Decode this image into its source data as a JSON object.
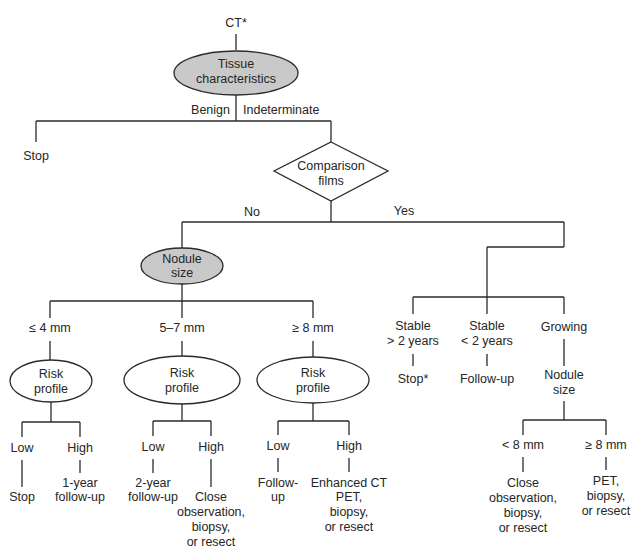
{
  "root": {
    "label": "CT*"
  },
  "tissue": {
    "line1": "Tissue",
    "line2": "characteristics",
    "fill": "#c9c9c9"
  },
  "branches_tissue": {
    "benign": "Benign",
    "indeterminate": "Indeterminate"
  },
  "benign_outcome": "Stop",
  "comparison": {
    "line1": "Comparison",
    "line2": "films"
  },
  "branches_comparison": {
    "no": "No",
    "yes": "Yes"
  },
  "nodule": {
    "line1": "Nodule",
    "line2": "size",
    "fill": "#c9c9c9"
  },
  "size_branches": [
    "≤ 4 mm",
    "5–7 mm",
    "≥ 8 mm"
  ],
  "risk_profile": {
    "line1": "Risk",
    "line2": "profile"
  },
  "risk_levels": {
    "low": "Low",
    "high": "High"
  },
  "outcomes_small": {
    "low": "Stop",
    "high": [
      "1-year",
      "follow-up"
    ]
  },
  "outcomes_mid": {
    "low": [
      "2-year",
      "follow-up"
    ],
    "high": [
      "Close",
      "observation,",
      "biopsy,",
      "or resect"
    ]
  },
  "outcomes_large": {
    "low": [
      "Follow-",
      "up"
    ],
    "high": [
      "Enhanced CT",
      "PET,",
      "biopsy,",
      "or resect"
    ]
  },
  "yes_branches": {
    "stable_gt": [
      "Stable",
      "> 2 years"
    ],
    "stable_lt": [
      "Stable",
      "< 2 years"
    ],
    "growing": "Growing"
  },
  "yes_outcomes": {
    "stable_gt": "Stop*",
    "stable_lt": "Follow-up",
    "growing_node": [
      "Nodule",
      "size"
    ]
  },
  "growing_sizes": [
    "< 8 mm",
    "≥ 8 mm"
  ],
  "growing_outcomes": {
    "small": [
      "Close",
      "observation,",
      "biopsy,",
      "or resect"
    ],
    "large": [
      "PET,",
      "biopsy,",
      "or resect"
    ]
  }
}
